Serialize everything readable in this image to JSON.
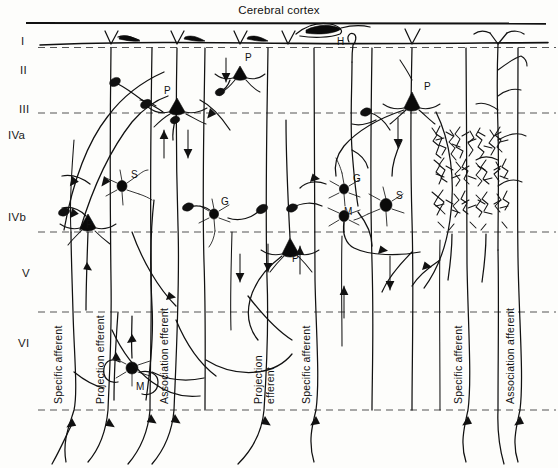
{
  "figure": {
    "title": "Cerebral cortex",
    "width": 558,
    "height": 468,
    "ink_color": "#111111",
    "background_color": "#fdfdfb",
    "layer_line_color": "#555555"
  },
  "layers": [
    {
      "id": "I",
      "label": "I",
      "label_y": 41
    },
    {
      "id": "II",
      "label": "II",
      "label_y": 70
    },
    {
      "id": "III",
      "label": "III",
      "label_y": 109
    },
    {
      "id": "IVa",
      "label": "IVa",
      "label_y": 134
    },
    {
      "id": "IVb",
      "label": "IVb",
      "label_y": 216
    },
    {
      "id": "V",
      "label": "V",
      "label_y": 272
    },
    {
      "id": "VI",
      "label": "VI",
      "label_y": 342
    }
  ],
  "boundaries": [
    {
      "name": "pia-surface",
      "y": 43,
      "style": "solid"
    },
    {
      "name": "layer-I-II",
      "y": 47,
      "style": "dashed"
    },
    {
      "name": "layer-II-III",
      "y": 113,
      "style": "dashed"
    },
    {
      "name": "layer-IVa-IVb",
      "y": 232,
      "style": "dashed"
    },
    {
      "name": "layer-V-VI",
      "y": 312,
      "style": "dashed"
    },
    {
      "name": "white-matter",
      "y": 410,
      "style": "dashed"
    }
  ],
  "cell_labels": [
    {
      "type": "H",
      "name": "horizontal-cell-label",
      "text": "H",
      "x": 337,
      "y": 45
    },
    {
      "type": "P",
      "name": "pyramidal-cell-label-1",
      "text": "P",
      "x": 245,
      "y": 61
    },
    {
      "type": "P",
      "name": "pyramidal-cell-label-2",
      "text": "P",
      "x": 164,
      "y": 98
    },
    {
      "type": "P",
      "name": "pyramidal-cell-label-3",
      "text": "P",
      "x": 424,
      "y": 94
    },
    {
      "type": "S",
      "name": "stellate-cell-label-1",
      "text": "S",
      "x": 130,
      "y": 180
    },
    {
      "type": "G",
      "name": "granule-cell-label-1",
      "text": "G",
      "x": 220,
      "y": 206
    },
    {
      "type": "G",
      "name": "granule-cell-label-2",
      "text": "G",
      "x": 355,
      "y": 183
    },
    {
      "type": "S",
      "name": "stellate-cell-label-2",
      "text": "S",
      "x": 397,
      "y": 199
    },
    {
      "type": "M",
      "name": "martinotti-cell-label-1",
      "text": "M",
      "x": 348,
      "y": 212
    },
    {
      "type": "P",
      "name": "pyramidal-cell-label-4",
      "text": "P",
      "x": 86,
      "y": 231
    },
    {
      "type": "P",
      "name": "pyramidal-cell-label-5",
      "text": "P",
      "x": 292,
      "y": 262
    },
    {
      "type": "M",
      "name": "martinotti-cell-label-2",
      "text": "M",
      "x": 139,
      "y": 382
    }
  ],
  "fiber_labels": [
    {
      "name": "specific-afferent-left",
      "text": "Specific afferent",
      "x": 64,
      "y": 404,
      "lines": 1
    },
    {
      "name": "projection-efferent-left",
      "text": "Projection efferent",
      "x": 105,
      "y": 404,
      "lines": 1
    },
    {
      "name": "association-efferent",
      "text": "Association efferent",
      "x": 172,
      "y": 300,
      "lines": 1
    },
    {
      "name": "projection-efferent-middle",
      "text": "Projection efferent",
      "x": 270,
      "y": 404,
      "lines": 2,
      "line1": "Projection",
      "line2": "efferent"
    },
    {
      "name": "specific-afferent-middle",
      "text": "Specific afferent",
      "x": 320,
      "y": 404,
      "lines": 1
    },
    {
      "name": "specific-afferent-right",
      "text": "Specific afferent",
      "x": 458,
      "y": 404,
      "lines": 1
    },
    {
      "name": "association-afferent-right",
      "text": "Association afferent",
      "x": 513,
      "y": 404,
      "lines": 1
    }
  ],
  "features": {
    "dense_arborization": {
      "name": "dense-terminal-arborization",
      "x": 428,
      "y": 124,
      "width": 84,
      "height": 110
    },
    "apical_tufts_count": 6,
    "vertical_fibers_count": 14
  }
}
